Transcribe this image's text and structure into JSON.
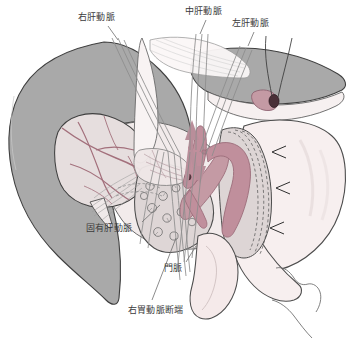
{
  "figure": {
    "background_color": "#ffffff",
    "palette": {
      "liver_gray": "#a9a9a9",
      "liver_gray_edge": "#4a4a4a",
      "liver_light": "#e9e3e4",
      "artery_rose": "#c08f9c",
      "artery_rose_dark": "#a8707f",
      "vessel_line": "#a3707c",
      "organ_pale": "#f5ecec",
      "organ_pale_2": "#efe6e6",
      "pancreas": "#ded7d7",
      "outline": "#4d4d4d",
      "thread": "#8c8c8c",
      "label_text": "#3b3b3b"
    }
  },
  "labels": [
    {
      "id": "right-hepatic-artery",
      "text": "右肝動脈",
      "x": 78,
      "y": 12
    },
    {
      "id": "middle-hepatic-artery",
      "text": "中肝動脈",
      "x": 185,
      "y": 6
    },
    {
      "id": "left-hepatic-artery",
      "text": "左肝動脈",
      "x": 232,
      "y": 18
    },
    {
      "id": "proper-hepatic-artery",
      "text": "固有肝動脈",
      "x": 86,
      "y": 223
    },
    {
      "id": "portal-vein",
      "text": "門脈",
      "x": 164,
      "y": 263
    },
    {
      "id": "right-gastric-stump",
      "text": "右胃動脈断端",
      "x": 128,
      "y": 305
    }
  ],
  "leader_lines": [
    {
      "id": "leader-right-hepatic",
      "x1": 108,
      "y1": 26,
      "x2": 118,
      "y2": 40
    },
    {
      "id": "leader-middle-hepatic",
      "x1": 206,
      "y1": 20,
      "x2": 200,
      "y2": 34
    },
    {
      "id": "leader-left-hepatic",
      "x1": 254,
      "y1": 32,
      "x2": 248,
      "y2": 46
    },
    {
      "id": "leader-proper-hepatic",
      "x1": 142,
      "y1": 222,
      "x2": 160,
      "y2": 205
    },
    {
      "id": "leader-portal-vein",
      "x1": 186,
      "y1": 262,
      "x2": 196,
      "y2": 246
    },
    {
      "id": "leader-right-gastric",
      "x1": 152,
      "y1": 300,
      "x2": 176,
      "y2": 238
    }
  ],
  "structures": [
    {
      "id": "liver-gray-lobe",
      "name": "肝臓（灰色部）"
    },
    {
      "id": "liver-inner-lobe",
      "name": "肝内区域"
    },
    {
      "id": "liver-right-lobe",
      "name": "右葉"
    },
    {
      "id": "stomach",
      "name": "胃"
    },
    {
      "id": "duodenum",
      "name": "十二指腸"
    },
    {
      "id": "pancreas",
      "name": "膵臓"
    },
    {
      "id": "hepatic-artery-trunk",
      "name": "肝動脈本幹"
    },
    {
      "id": "portal-vein-vessel",
      "name": "門脈本幹"
    },
    {
      "id": "ligated-stump",
      "name": "結紮断端"
    },
    {
      "id": "retraction-threads",
      "name": "牽引糸"
    },
    {
      "id": "gastric-band",
      "name": "胃壁帯状部"
    },
    {
      "id": "arrow-up",
      "name": "上向き矢印"
    },
    {
      "id": "arrow-down",
      "name": "下向き矢印"
    }
  ]
}
